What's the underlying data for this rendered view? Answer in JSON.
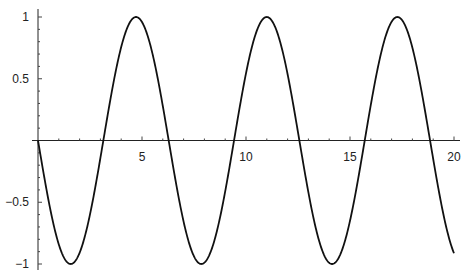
{
  "chart_data": {
    "type": "line",
    "title": "",
    "xlabel": "",
    "ylabel": "",
    "function": "-sin(x)",
    "xlim": [
      0,
      20
    ],
    "ylim": [
      -1,
      1
    ],
    "x_ticks": [
      5,
      10,
      15,
      20
    ],
    "x_tick_labels": [
      "5",
      "10",
      "15",
      "20"
    ],
    "y_ticks": [
      1,
      0.5,
      -0.5,
      -1
    ],
    "y_tick_labels": [
      "1",
      "0.5",
      "−0.5",
      "−1"
    ],
    "grid": false,
    "legend": null,
    "series": [
      {
        "name": "-sin(x)",
        "x": [
          0,
          1.5708,
          3.1416,
          4.7124,
          6.2832,
          7.854,
          9.4248,
          10.9956,
          12.5664,
          14.1372,
          15.708,
          17.2788,
          18.8496,
          20
        ],
        "values": [
          0,
          -1,
          0,
          1,
          0,
          -1,
          0,
          1,
          0,
          -1,
          0,
          1,
          0,
          -0.913
        ]
      }
    ]
  }
}
